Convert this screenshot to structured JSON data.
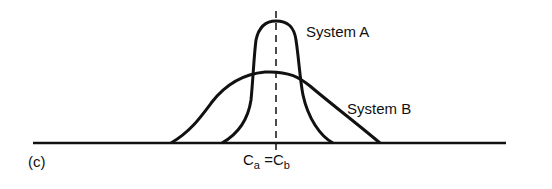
{
  "figure": {
    "panel_label": "(c)",
    "series": [
      {
        "name": "System A",
        "label": "System A",
        "shape": "narrow, tall distribution"
      },
      {
        "name": "System B",
        "label": "System B",
        "shape": "wide, low distribution"
      }
    ],
    "center_label": {
      "left_symbol": "C",
      "left_sub": "a",
      "equals": "=",
      "right_symbol": "C",
      "right_sub": "b"
    },
    "colors": {
      "stroke": "#111111",
      "background": "#ffffff"
    }
  }
}
